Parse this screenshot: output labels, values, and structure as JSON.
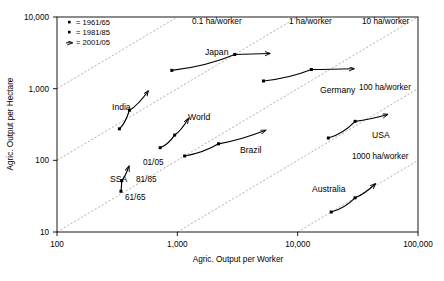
{
  "chart_data": {
    "type": "scatter",
    "title": "",
    "xlabel": "Agric. Output per Worker",
    "ylabel": "Agric. Output per Hectare",
    "xscale": "log",
    "yscale": "log",
    "xlim": [
      100,
      100000
    ],
    "ylim": [
      10,
      10000
    ],
    "xticks": [
      "100",
      "1,000",
      "10,000",
      "100,000"
    ],
    "xtick_values": [
      100,
      1000,
      10000,
      100000
    ],
    "yticks": [
      "10,000",
      "1,000",
      "100",
      "10"
    ],
    "ytick_values": [
      10000,
      1000,
      100,
      10
    ],
    "grid": false,
    "legend_position": "top-left",
    "legend": [
      {
        "symbol": "square-small",
        "label": "= 1961/65"
      },
      {
        "symbol": "square-small",
        "label": "= 1981/85"
      },
      {
        "symbol": "arrow-head",
        "label": "= 2001/05"
      }
    ],
    "reference_lines": [
      {
        "label": "0.1 ha/worker",
        "ratio": 0.1,
        "label_x": 192,
        "label_y": 24
      },
      {
        "label": "1 ha/worker",
        "ratio": 1,
        "label_x": 289,
        "label_y": 24
      },
      {
        "label": "10 ha/worker",
        "ratio": 10,
        "label_x": 362,
        "label_y": 24
      },
      {
        "label": "100 ha/worker",
        "ratio": 100,
        "label_x": 359,
        "label_y": 90
      },
      {
        "label": "1000 ha/worker",
        "ratio": 1000,
        "label_x": 352,
        "label_y": 159
      }
    ],
    "series": [
      {
        "name": "Japan",
        "label_x": 205,
        "label_y": 55,
        "points": [
          [
            900,
            1800
          ],
          [
            3000,
            3000
          ],
          [
            6000,
            3100
          ]
        ],
        "years": [
          "1961/65",
          "1981/85",
          "2001/05"
        ]
      },
      {
        "name": "Germany",
        "label_x": 320,
        "label_y": 93,
        "points": [
          [
            5200,
            1280
          ],
          [
            13000,
            1850
          ],
          [
            30000,
            1900
          ]
        ],
        "years": [
          "1961/65",
          "1981/85",
          "2001/05"
        ]
      },
      {
        "name": "India",
        "label_x": 112,
        "label_y": 110,
        "points": [
          [
            330,
            275
          ],
          [
            400,
            500
          ],
          [
            580,
            950
          ]
        ],
        "years": [
          "1961/65",
          "1981/85",
          "2001/05"
        ]
      },
      {
        "name": "World",
        "label_x": 188,
        "label_y": 120,
        "points": [
          [
            720,
            150
          ],
          [
            950,
            225
          ],
          [
            1250,
            390
          ]
        ],
        "years": [
          "1961/65",
          "1981/85",
          "2001/05"
        ]
      },
      {
        "name": "Brazil",
        "label_x": 240,
        "label_y": 153,
        "points": [
          [
            1150,
            115
          ],
          [
            2200,
            170
          ],
          [
            5500,
            265
          ]
        ],
        "years": [
          "1961/65",
          "1981/85",
          "2001/05"
        ]
      },
      {
        "name": "USA",
        "label_x": 372,
        "label_y": 138,
        "points": [
          [
            18000,
            205
          ],
          [
            30000,
            350
          ],
          [
            57000,
            440
          ]
        ],
        "years": [
          "1961/65",
          "1981/85",
          "2001/05"
        ]
      },
      {
        "name": "SSA",
        "label_x": 110,
        "label_y": 182,
        "points": [
          [
            340,
            37
          ],
          [
            345,
            52
          ],
          [
            400,
            85
          ]
        ],
        "years": [
          "1961/65",
          "1981/85",
          "2001/05"
        ],
        "point_labels": [
          "61/65",
          "81/85",
          "01/05"
        ]
      },
      {
        "name": "Australia",
        "label_x": 312,
        "label_y": 192,
        "points": [
          [
            19000,
            19
          ],
          [
            30000,
            30
          ],
          [
            45000,
            48
          ]
        ],
        "years": [
          "1961/65",
          "1981/85",
          "2001/05"
        ]
      }
    ],
    "annotations": [
      {
        "text": "01/05",
        "x": 143,
        "y": 165
      },
      {
        "text": "81/85",
        "x": 136,
        "y": 182
      },
      {
        "text": "61/65",
        "x": 125,
        "y": 200
      }
    ]
  }
}
